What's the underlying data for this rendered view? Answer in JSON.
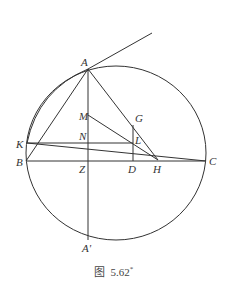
{
  "figure": {
    "caption_prefix": "图",
    "caption_number": "5.62",
    "caption_mark": "*",
    "stroke_color": "#333333",
    "background": "#ffffff"
  },
  "points": {
    "A": {
      "label": "A",
      "x": 88,
      "y": 69
    },
    "A'": {
      "label": "A'",
      "x": 88,
      "y": 240
    },
    "B": {
      "label": "B",
      "x": 26,
      "y": 161
    },
    "C": {
      "label": "C",
      "x": 206,
      "y": 161
    },
    "K": {
      "label": "K",
      "x": 27,
      "y": 143
    },
    "M": {
      "label": "M",
      "x": 88,
      "y": 115
    },
    "N": {
      "label": "N",
      "x": 88,
      "y": 143
    },
    "Z": {
      "label": "Z",
      "x": 88,
      "y": 161
    },
    "G": {
      "label": "G",
      "x": 133,
      "y": 125
    },
    "L": {
      "label": "L",
      "x": 133,
      "y": 143
    },
    "D": {
      "label": "D",
      "x": 133,
      "y": 161
    },
    "H": {
      "label": "H",
      "x": 158,
      "y": 160
    }
  },
  "labels": {
    "A": "A",
    "A_prime": "A'",
    "B": "B",
    "C": "C",
    "K": "K",
    "M": "M",
    "N": "N",
    "Z": "Z",
    "G": "G",
    "L": "L",
    "D": "D",
    "H": "H"
  },
  "circle": {
    "cx": 116,
    "cy": 153,
    "rx": 91,
    "ry": 88
  },
  "segments": [
    [
      "A",
      "A'"
    ],
    [
      "A",
      "B"
    ],
    [
      "A",
      "H"
    ],
    [
      "M",
      "H"
    ],
    [
      "K",
      "L"
    ],
    [
      "K",
      "C"
    ],
    [
      "B",
      "C"
    ],
    [
      "G",
      "D"
    ]
  ],
  "arcs": [
    [
      "A",
      "K"
    ]
  ],
  "tangent": {
    "from": "A",
    "to_x": 152,
    "to_y": 33
  }
}
